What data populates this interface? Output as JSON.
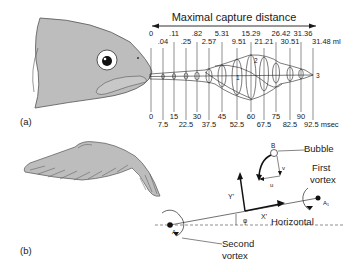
{
  "panel_a": {
    "label": "(a)",
    "title": "Maximal capture distance",
    "volume_unit": "ml",
    "time_unit": "msec",
    "volume_ticks_top": [
      ".11",
      ".82",
      "5.31",
      "15.29",
      "26.42",
      "31.36"
    ],
    "volume_ticks_bottom": [
      "0",
      ".04",
      ".25",
      "2.57",
      "9.51",
      "21.21",
      "30.51",
      "31.48 ml"
    ],
    "time_ticks_top": [
      "0",
      "15",
      "30",
      "45",
      "60",
      "75",
      "90"
    ],
    "time_ticks_bottom": [
      "7.5",
      "22.5",
      "37.5",
      "52.5",
      "67.5",
      "82.5",
      "92.5 msec"
    ],
    "vortex_numbers": [
      "1",
      "2",
      "3"
    ]
  },
  "panel_b": {
    "label": "(b)",
    "bubble_label": "Bubble",
    "bubble_point": "B",
    "v_label": "v",
    "u_label": "u",
    "y_axis": "Y'",
    "x_axis": "X'",
    "phi": "φ",
    "horizontal": "Horizontal",
    "first_vortex_1": "First",
    "first_vortex_2": "vortex",
    "a1": "A₁",
    "a2": "A₂",
    "second_vortex_1": "Second",
    "second_vortex_2": "vortex"
  },
  "colors": {
    "fill_gray": "#bdbdbd",
    "line": "#1a1a1a"
  }
}
